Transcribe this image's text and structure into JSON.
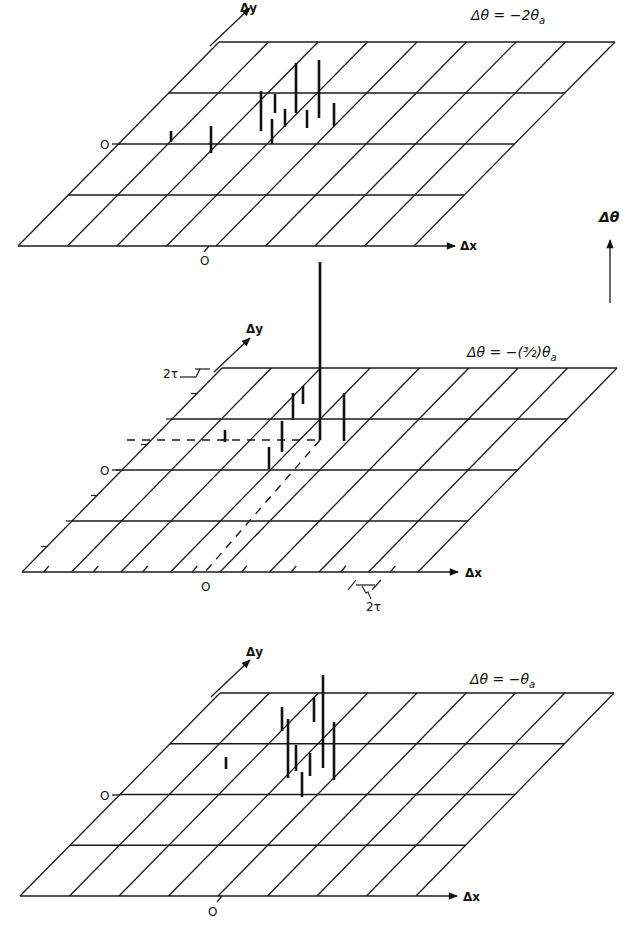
{
  "figure": {
    "theta_axis_label": "Δθ",
    "panels": [
      {
        "id": "top",
        "title": "Δθ = −2θ",
        "title_sub": "a",
        "x_label": "Δx",
        "y_label": "Δy",
        "origin_x_label": "O",
        "origin_y_label": "O"
      },
      {
        "id": "middle",
        "title": "Δθ = −(³⁄₂)θ",
        "title_sub": "a",
        "x_label": "Δx",
        "y_label": "Δy",
        "origin_x_label": "O",
        "origin_y_label": "O",
        "scale_label_y": "2τ",
        "scale_label_x": "2τ"
      },
      {
        "id": "bottom",
        "title": "Δθ = −θ",
        "title_sub": "a",
        "x_label": "Δx",
        "y_label": "Δy",
        "origin_x_label": "O",
        "origin_y_label": "O"
      }
    ]
  },
  "chart_data": {
    "type": "3d-stem-on-sheared-grid",
    "z_axis_label": "Δθ",
    "grid": {
      "columns": 8,
      "rows": 4,
      "grid_on": true
    },
    "panels": [
      {
        "label": "Δθ = −2θa",
        "grid_box": {
          "bottom_left": [
            18,
            246
          ],
          "top_left": [
            219,
            42
          ],
          "top_right": [
            615,
            42
          ],
          "bottom_right": [
            414,
            246
          ]
        },
        "spikes_screen": [
          {
            "x": 171,
            "y_top": 131,
            "y_base": 142
          },
          {
            "x": 211,
            "y_top": 126,
            "y_base": 153
          },
          {
            "x": 261,
            "y_top": 91,
            "y_base": 131
          },
          {
            "x": 272,
            "y_top": 119,
            "y_base": 144
          },
          {
            "x": 275,
            "y_top": 94,
            "y_base": 113
          },
          {
            "x": 285,
            "y_top": 109,
            "y_base": 127
          },
          {
            "x": 296,
            "y_top": 63,
            "y_base": 113
          },
          {
            "x": 307,
            "y_top": 110,
            "y_base": 128
          },
          {
            "x": 319,
            "y_top": 60,
            "y_base": 118
          },
          {
            "x": 334,
            "y_top": 103,
            "y_base": 126
          }
        ]
      },
      {
        "label": "Δθ = −(3/2)θa",
        "grid_box": {
          "bottom_left": [
            22,
            572
          ],
          "top_left": [
            222,
            368
          ],
          "top_right": [
            617,
            368
          ],
          "bottom_right": [
            418,
            572
          ]
        },
        "spikes_screen": [
          {
            "x": 225,
            "y_top": 430,
            "y_base": 442
          },
          {
            "x": 269,
            "y_top": 447,
            "y_base": 469
          },
          {
            "x": 282,
            "y_top": 421,
            "y_base": 452
          },
          {
            "x": 293,
            "y_top": 393,
            "y_base": 420
          },
          {
            "x": 303,
            "y_top": 386,
            "y_base": 404
          },
          {
            "x": 320,
            "y_top": 262,
            "y_base": 440,
            "note": "principal peak"
          },
          {
            "x": 344,
            "y_top": 393,
            "y_base": 441
          }
        ],
        "peak_projection": {
          "horizontal_to_y_axis_y": 440,
          "diagonal_to_x_axis_x": 205
        }
      },
      {
        "label": "Δθ = −θa",
        "grid_box": {
          "bottom_left": [
            20,
            896
          ],
          "top_left": [
            220,
            693
          ],
          "top_right": [
            614,
            693
          ],
          "bottom_right": [
            416,
            896
          ]
        },
        "spikes_screen": [
          {
            "x": 226,
            "y_top": 757,
            "y_base": 769
          },
          {
            "x": 282,
            "y_top": 707,
            "y_base": 731
          },
          {
            "x": 288,
            "y_top": 719,
            "y_base": 778
          },
          {
            "x": 296,
            "y_top": 745,
            "y_base": 771
          },
          {
            "x": 302,
            "y_top": 772,
            "y_base": 797
          },
          {
            "x": 310,
            "y_top": 753,
            "y_base": 776
          },
          {
            "x": 314,
            "y_top": 698,
            "y_base": 722
          },
          {
            "x": 323,
            "y_top": 675,
            "y_base": 768
          },
          {
            "x": 334,
            "y_top": 722,
            "y_base": 780
          }
        ]
      }
    ]
  }
}
